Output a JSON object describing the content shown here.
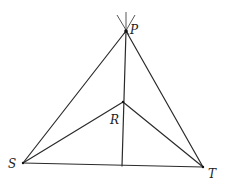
{
  "diagram": {
    "type": "geometry",
    "points": {
      "P": {
        "label": "P",
        "x": 126,
        "y": 31
      },
      "S": {
        "label": "S",
        "x": 23,
        "y": 163
      },
      "T": {
        "label": "T",
        "x": 203,
        "y": 167
      },
      "R": {
        "label": "R",
        "x": 123,
        "y": 102
      },
      "F": {
        "label": "",
        "x": 122,
        "y": 165
      }
    },
    "segments": [
      [
        "P",
        "S"
      ],
      [
        "P",
        "T"
      ],
      [
        "S",
        "T"
      ],
      [
        "S",
        "R"
      ],
      [
        "R",
        "T"
      ],
      [
        "P",
        "F"
      ]
    ],
    "labels": {
      "P": "P",
      "R": "R",
      "S": "S",
      "T": "T"
    },
    "colors": {
      "line": "#2a2a2a",
      "background": "#ffffff"
    }
  }
}
